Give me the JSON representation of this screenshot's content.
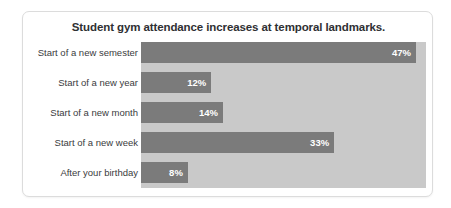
{
  "chart_data": {
    "type": "bar",
    "orientation": "horizontal",
    "title": "Student gym attendance increases at temporal landmarks.",
    "xlabel": "",
    "ylabel": "",
    "categories": [
      "Start of a new semester",
      "Start of a new year",
      "Start of a new month",
      "Start of a new week",
      "After your birthday"
    ],
    "values": [
      47,
      12,
      14,
      33,
      8
    ],
    "value_labels": [
      "47%",
      "12%",
      "14%",
      "33%",
      "8%"
    ],
    "xlim": [
      0,
      48.7
    ],
    "grid": false,
    "legend": false,
    "colors": {
      "bar": "#7b7b7b",
      "plot_background": "#c9c9c9",
      "card_background": "#ffffff",
      "title_text": "#2f3033",
      "label_text": "#3a3b3d",
      "value_text": "#ffffff",
      "card_border": "#dcdcdc"
    }
  }
}
